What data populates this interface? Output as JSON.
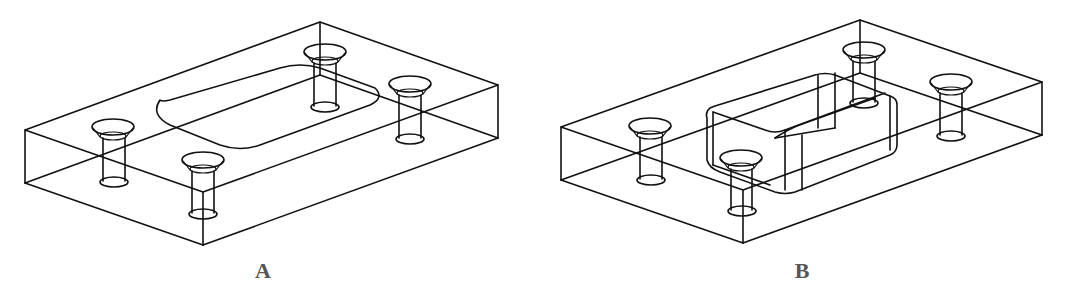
{
  "figures": [
    {
      "id": "A",
      "label": "A",
      "description": "Isometric wireframe of rectangular plate with four countersunk through-holes and a rounded-rectangle outline on the top face"
    },
    {
      "id": "B",
      "label": "B",
      "description": "Isometric wireframe of rectangular plate with four countersunk through-holes and a raised rounded-rectangle boss (extruded pocket) on top face"
    }
  ],
  "colors": {
    "line": "#111111",
    "caption": "#555555",
    "background": "#ffffff"
  }
}
